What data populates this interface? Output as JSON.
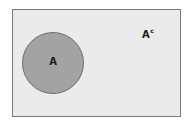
{
  "diagram": {
    "type": "venn",
    "universe": {
      "label": "",
      "fill": "#ebebeb",
      "stroke": "#7a7a7a"
    },
    "sets": [
      {
        "name": "A",
        "label": "A",
        "fill": "#a3a3a3",
        "stroke": "#6e6e6e"
      }
    ],
    "complement": {
      "base": "A",
      "superscript": "c"
    }
  }
}
